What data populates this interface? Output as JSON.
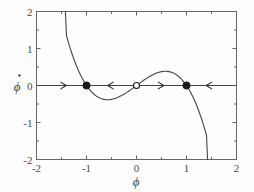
{
  "figure": {
    "background_color": "#fdfdfd",
    "axis_color": "#555555",
    "curve_color": "#444444",
    "marker_color": "#1a1a1a"
  },
  "chart_data": {
    "type": "line",
    "title": "",
    "subtitle": "",
    "xlabel": "ϕ",
    "ylabel": "ϕ̇",
    "ylabel_base": "ϕ",
    "ylabel_accent": "̇",
    "xlim": [
      -2,
      2
    ],
    "ylim": [
      -2,
      2
    ],
    "grid": false,
    "legend": null,
    "legend_position": "none",
    "xticks": [
      -2,
      -1,
      0,
      1,
      2
    ],
    "xtick_labels": [
      "-2",
      "-1",
      "0",
      "1",
      "2"
    ],
    "yticks": [
      -2,
      -1,
      0,
      1,
      2
    ],
    "ytick_labels": [
      "-2",
      "-1",
      "0",
      "1",
      "2"
    ],
    "minor_tick_step": 0.5,
    "series": [
      {
        "name": "phi - phi^3",
        "equation": "y = ϕ − ϕ³",
        "color": "#444444",
        "x": [
          -1.4214,
          -1.4,
          -1.35,
          -1.3,
          -1.25,
          -1.2,
          -1.15,
          -1.1,
          -1.05,
          -1.0,
          -0.95,
          -0.9,
          -0.85,
          -0.8,
          -0.75,
          -0.7,
          -0.65,
          -0.6,
          -0.577,
          -0.55,
          -0.5,
          -0.45,
          -0.4,
          -0.35,
          -0.3,
          -0.25,
          -0.2,
          -0.15,
          -0.1,
          -0.05,
          0.0,
          0.05,
          0.1,
          0.15,
          0.2,
          0.25,
          0.3,
          0.35,
          0.4,
          0.45,
          0.5,
          0.55,
          0.577,
          0.6,
          0.65,
          0.7,
          0.75,
          0.8,
          0.85,
          0.9,
          0.95,
          1.0,
          1.05,
          1.1,
          1.15,
          1.2,
          1.25,
          1.3,
          1.35,
          1.4,
          1.4214
        ],
        "y": [
          2.0,
          1.344,
          1.111,
          0.897,
          0.703,
          0.528,
          0.371,
          0.231,
          0.108,
          0.0,
          -0.093,
          -0.171,
          -0.236,
          -0.288,
          -0.328,
          -0.357,
          -0.375,
          -0.384,
          -0.3849,
          -0.384,
          -0.375,
          -0.359,
          -0.336,
          -0.307,
          -0.273,
          -0.234,
          -0.192,
          -0.147,
          -0.099,
          -0.05,
          0.0,
          0.05,
          0.099,
          0.147,
          0.192,
          0.234,
          0.273,
          0.307,
          0.336,
          0.359,
          0.375,
          0.384,
          0.3849,
          0.384,
          0.375,
          0.357,
          0.328,
          0.288,
          0.236,
          0.171,
          0.093,
          0.0,
          -0.108,
          -0.231,
          -0.371,
          -0.528,
          -0.703,
          -0.897,
          -1.111,
          -1.344,
          -2.0
        ]
      }
    ],
    "fixed_points": [
      {
        "name": "stable-left",
        "x": -1.0,
        "y": 0.0,
        "style": "filled"
      },
      {
        "name": "unstable-origin",
        "x": 0.0,
        "y": 0.0,
        "style": "open"
      },
      {
        "name": "stable-right",
        "x": 1.0,
        "y": 0.0,
        "style": "filled"
      }
    ],
    "flow_arrows": [
      {
        "name": "arrow-1",
        "x": -1.43,
        "y": 0.0,
        "direction": "right"
      },
      {
        "name": "arrow-2",
        "x": -0.55,
        "y": 0.0,
        "direction": "left"
      },
      {
        "name": "arrow-3",
        "x": 0.52,
        "y": 0.0,
        "direction": "right"
      },
      {
        "name": "arrow-4",
        "x": 1.42,
        "y": 0.0,
        "direction": "left"
      }
    ],
    "annotations": []
  }
}
